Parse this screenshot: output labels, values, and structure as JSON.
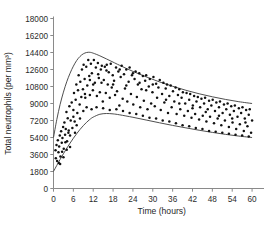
{
  "figure": {
    "background": "#ffffff",
    "axis_color": "#8a8a8a",
    "curve_color": "#3a3a3a",
    "dot_color": "#111111",
    "caption_partial": ""
  },
  "chart_data": {
    "type": "scatter",
    "title": "",
    "subtitle": "",
    "xlabel": "Time (hours)",
    "ylabel": "Total neutrophils (per mm³)",
    "xlim": [
      0,
      63
    ],
    "ylim": [
      0,
      18000
    ],
    "grid": false,
    "legend": null,
    "legend_position": "none",
    "xticks": [
      0,
      6,
      12,
      18,
      24,
      30,
      36,
      42,
      48,
      54,
      60
    ],
    "xtick_labels": [
      "0",
      "6",
      "12",
      "18",
      "24",
      "30",
      "36",
      "42",
      "48",
      "54",
      "60"
    ],
    "yticks": [
      0,
      1800,
      3600,
      5400,
      7200,
      9000,
      10800,
      12600,
      14400,
      16200,
      18000
    ],
    "ytick_labels": [
      "0",
      "1800",
      "3600",
      "5400",
      "7200",
      "9000",
      "10800",
      "12600",
      "14400",
      "16200",
      "18000"
    ],
    "annotations": [],
    "series": [
      {
        "name": "Upper envelope",
        "type": "line",
        "x": [
          0,
          1,
          2,
          3,
          4,
          5,
          6,
          7,
          8,
          9,
          10,
          11,
          12,
          14,
          16,
          18,
          20,
          24,
          28,
          32,
          36,
          40,
          44,
          48,
          52,
          56,
          60
        ],
        "values": [
          5400,
          7300,
          8900,
          10200,
          11300,
          12200,
          12950,
          13550,
          13980,
          14260,
          14400,
          14420,
          14330,
          14050,
          13720,
          13380,
          13040,
          12400,
          11820,
          11290,
          10820,
          10400,
          10030,
          9710,
          9430,
          9190,
          9000
        ]
      },
      {
        "name": "Lower envelope",
        "type": "line",
        "x": [
          0,
          1,
          2,
          3,
          4,
          5,
          6,
          7,
          8,
          9,
          10,
          11,
          12,
          14,
          16,
          18,
          20,
          24,
          28,
          32,
          36,
          40,
          44,
          48,
          52,
          56,
          60
        ],
        "values": [
          1800,
          2450,
          3080,
          3680,
          4260,
          4800,
          5320,
          5800,
          6250,
          6650,
          7010,
          7320,
          7560,
          7860,
          7940,
          7900,
          7800,
          7540,
          7250,
          6960,
          6680,
          6420,
          6170,
          5940,
          5730,
          5550,
          5400
        ]
      },
      {
        "name": "Observations",
        "type": "scatter",
        "points": [
          [
            0.6,
            4050
          ],
          [
            0.7,
            3200
          ],
          [
            0.9,
            4600
          ],
          [
            1.1,
            2900
          ],
          [
            1.3,
            5100
          ],
          [
            1.5,
            3850
          ],
          [
            1.7,
            4450
          ],
          [
            1.9,
            5600
          ],
          [
            2.1,
            3400
          ],
          [
            2.3,
            6050
          ],
          [
            2.5,
            4850
          ],
          [
            2.7,
            5350
          ],
          [
            2.9,
            6500
          ],
          [
            3.1,
            4200
          ],
          [
            3.3,
            7000
          ],
          [
            3.5,
            5700
          ],
          [
            3.7,
            6300
          ],
          [
            3.9,
            8100
          ],
          [
            4.1,
            5000
          ],
          [
            4.3,
            7450
          ],
          [
            4.6,
            6150
          ],
          [
            4.8,
            8700
          ],
          [
            5.0,
            5600
          ],
          [
            5.2,
            7200
          ],
          [
            5.5,
            9100
          ],
          [
            5.7,
            6400
          ],
          [
            6.0,
            8300
          ],
          [
            6.2,
            10100
          ],
          [
            6.4,
            7100
          ],
          [
            6.7,
            9400
          ],
          [
            6.9,
            11000
          ],
          [
            7.2,
            8000
          ],
          [
            7.4,
            10400
          ],
          [
            7.6,
            12000
          ],
          [
            7.9,
            8900
          ],
          [
            8.1,
            11300
          ],
          [
            8.4,
            9700
          ],
          [
            8.6,
            12600
          ],
          [
            8.9,
            10500
          ],
          [
            9.1,
            13100
          ],
          [
            9.4,
            11600
          ],
          [
            9.6,
            9600
          ],
          [
            9.9,
            12900
          ],
          [
            10.2,
            10900
          ],
          [
            10.5,
            13600
          ],
          [
            10.8,
            11900
          ],
          [
            11.0,
            9900
          ],
          [
            11.3,
            13200
          ],
          [
            11.6,
            12200
          ],
          [
            11.9,
            10400
          ],
          [
            12.2,
            13600
          ],
          [
            12.5,
            11200
          ],
          [
            12.8,
            12800
          ],
          [
            13.1,
            9800
          ],
          [
            13.4,
            13300
          ],
          [
            13.7,
            11700
          ],
          [
            14.0,
            10200
          ],
          [
            14.3,
            12600
          ],
          [
            14.6,
            13000
          ],
          [
            14.9,
            9200
          ],
          [
            15.2,
            11500
          ],
          [
            15.5,
            12900
          ],
          [
            15.8,
            10100
          ],
          [
            16.1,
            13100
          ],
          [
            16.4,
            11000
          ],
          [
            16.7,
            12300
          ],
          [
            17.0,
            9600
          ],
          [
            17.3,
            13200
          ],
          [
            17.6,
            10700
          ],
          [
            17.9,
            12000
          ],
          [
            18.3,
            11400
          ],
          [
            18.6,
            9900
          ],
          [
            18.9,
            12800
          ],
          [
            19.2,
            10300
          ],
          [
            19.6,
            12400
          ],
          [
            19.9,
            8800
          ],
          [
            20.3,
            11800
          ],
          [
            20.6,
            13000
          ],
          [
            20.9,
            9500
          ],
          [
            21.3,
            12100
          ],
          [
            21.6,
            10600
          ],
          [
            22.0,
            12600
          ],
          [
            22.3,
            9200
          ],
          [
            22.7,
            11300
          ],
          [
            23.0,
            12800
          ],
          [
            23.4,
            10000
          ],
          [
            23.7,
            12000
          ],
          [
            24.1,
            8900
          ],
          [
            24.5,
            11600
          ],
          [
            24.8,
            12400
          ],
          [
            25.2,
            9700
          ],
          [
            25.5,
            11000
          ],
          [
            25.9,
            12200
          ],
          [
            26.2,
            8600
          ],
          [
            26.6,
            10500
          ],
          [
            27.0,
            11900
          ],
          [
            27.3,
            9300
          ],
          [
            27.7,
            11400
          ],
          [
            28.0,
            12000
          ],
          [
            28.4,
            8400
          ],
          [
            28.8,
            10800
          ],
          [
            29.1,
            11600
          ],
          [
            29.5,
            9000
          ],
          [
            29.9,
            10200
          ],
          [
            30.2,
            11800
          ],
          [
            30.6,
            8700
          ],
          [
            31.0,
            11100
          ],
          [
            31.3,
            9600
          ],
          [
            31.7,
            10700
          ],
          [
            32.1,
            11500
          ],
          [
            32.4,
            8300
          ],
          [
            32.8,
            10000
          ],
          [
            33.2,
            11200
          ],
          [
            33.5,
            9100
          ],
          [
            33.9,
            10600
          ],
          [
            34.3,
            11000
          ],
          [
            34.6,
            8000
          ],
          [
            35.0,
            9800
          ],
          [
            35.4,
            10900
          ],
          [
            35.7,
            8600
          ],
          [
            36.1,
            10300
          ],
          [
            36.5,
            9200
          ],
          [
            36.9,
            10700
          ],
          [
            37.2,
            7900
          ],
          [
            37.6,
            9900
          ],
          [
            38.0,
            10500
          ],
          [
            38.3,
            8400
          ],
          [
            38.7,
            9600
          ],
          [
            39.1,
            10200
          ],
          [
            39.5,
            7700
          ],
          [
            39.8,
            9000
          ],
          [
            40.2,
            10100
          ],
          [
            40.6,
            8200
          ],
          [
            41.0,
            9400
          ],
          [
            41.3,
            10000
          ],
          [
            41.7,
            7500
          ],
          [
            42.1,
            8800
          ],
          [
            42.5,
            9800
          ],
          [
            42.8,
            7900
          ],
          [
            43.2,
            9200
          ],
          [
            43.6,
            9700
          ],
          [
            44.0,
            7300
          ],
          [
            44.3,
            8600
          ],
          [
            44.7,
            9500
          ],
          [
            45.1,
            7700
          ],
          [
            45.5,
            9000
          ],
          [
            45.8,
            9600
          ],
          [
            46.2,
            7100
          ],
          [
            46.6,
            8400
          ],
          [
            47.0,
            9300
          ],
          [
            47.3,
            7600
          ],
          [
            47.7,
            8800
          ],
          [
            48.1,
            9400
          ],
          [
            48.5,
            6900
          ],
          [
            48.8,
            8200
          ],
          [
            49.2,
            9100
          ],
          [
            49.6,
            7400
          ],
          [
            50.0,
            8600
          ],
          [
            50.3,
            9200
          ],
          [
            50.7,
            6700
          ],
          [
            51.1,
            8000
          ],
          [
            51.5,
            8900
          ],
          [
            51.8,
            7200
          ],
          [
            52.2,
            8400
          ],
          [
            52.6,
            9000
          ],
          [
            53.0,
            6500
          ],
          [
            53.3,
            7800
          ],
          [
            53.7,
            8700
          ],
          [
            54.1,
            7000
          ],
          [
            54.5,
            8200
          ],
          [
            54.8,
            8800
          ],
          [
            55.2,
            6300
          ],
          [
            55.6,
            7600
          ],
          [
            56.0,
            8500
          ],
          [
            56.3,
            6800
          ],
          [
            56.7,
            8000
          ],
          [
            57.1,
            8600
          ],
          [
            57.5,
            6100
          ],
          [
            57.8,
            7400
          ],
          [
            58.2,
            8300
          ],
          [
            58.6,
            6600
          ],
          [
            59.0,
            7800
          ],
          [
            59.3,
            8400
          ],
          [
            59.7,
            5900
          ],
          [
            60.0,
            7200
          ],
          [
            2.0,
            2600
          ],
          [
            3.0,
            3300
          ],
          [
            4.0,
            4100
          ],
          [
            5.0,
            4400
          ],
          [
            6.5,
            5900
          ],
          [
            7.0,
            6700
          ],
          [
            8.0,
            7400
          ],
          [
            9.0,
            8200
          ],
          [
            10.0,
            8600
          ],
          [
            11.5,
            8400
          ],
          [
            13.0,
            8600
          ],
          [
            15.0,
            8500
          ],
          [
            17.0,
            8300
          ],
          [
            19.0,
            8400
          ],
          [
            21.0,
            8200
          ],
          [
            23.0,
            8000
          ],
          [
            25.0,
            7900
          ],
          [
            27.0,
            7700
          ],
          [
            29.0,
            7500
          ],
          [
            31.0,
            7400
          ],
          [
            33.0,
            7200
          ],
          [
            35.0,
            7100
          ],
          [
            37.0,
            6900
          ],
          [
            39.0,
            6700
          ],
          [
            41.0,
            6600
          ],
          [
            43.0,
            6400
          ],
          [
            45.0,
            6300
          ],
          [
            47.0,
            6100
          ],
          [
            49.0,
            6000
          ],
          [
            51.0,
            5900
          ],
          [
            53.0,
            5800
          ],
          [
            55.0,
            5700
          ],
          [
            57.0,
            5600
          ],
          [
            59.0,
            5500
          ],
          [
            12.0,
            11000
          ],
          [
            13.5,
            12100
          ],
          [
            16.0,
            12500
          ],
          [
            18.0,
            11000
          ],
          [
            20.0,
            12600
          ],
          [
            22.0,
            10900
          ],
          [
            24.0,
            12200
          ],
          [
            26.0,
            11200
          ],
          [
            28.0,
            10400
          ],
          [
            30.0,
            11000
          ],
          [
            34.0,
            9400
          ],
          [
            38.0,
            9000
          ],
          [
            42.0,
            8500
          ],
          [
            46.0,
            8100
          ],
          [
            50.0,
            7700
          ],
          [
            54.0,
            7400
          ],
          [
            58.0,
            7000
          ],
          [
            9.5,
            10000
          ],
          [
            11.0,
            11500
          ],
          [
            14.5,
            11200
          ],
          [
            6.0,
            7600
          ],
          [
            4.5,
            5900
          ],
          [
            3.6,
            4900
          ],
          [
            2.6,
            3900
          ],
          [
            1.6,
            2700
          ]
        ]
      }
    ]
  }
}
